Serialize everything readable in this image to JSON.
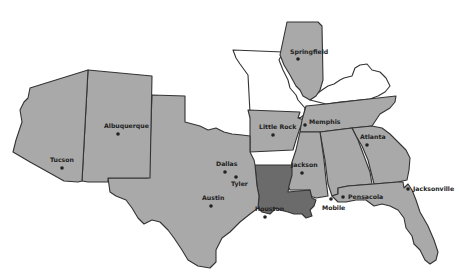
{
  "map": {
    "colors": {
      "background": "#ffffff",
      "state_fill": "#a9a9a9",
      "highlight_fill": "#6b6b6b",
      "outline_only_fill": "#ffffff",
      "stroke": "#333333",
      "label": "#222222"
    },
    "states": [
      {
        "id": "arizona",
        "style": "filled"
      },
      {
        "id": "new-mexico",
        "style": "filled"
      },
      {
        "id": "texas",
        "style": "filled"
      },
      {
        "id": "oklahoma-panhandle",
        "style": "filled"
      },
      {
        "id": "missouri",
        "style": "outline"
      },
      {
        "id": "illinois",
        "style": "filled"
      },
      {
        "id": "kentucky",
        "style": "outline"
      },
      {
        "id": "arkansas",
        "style": "filled"
      },
      {
        "id": "tennessee",
        "style": "filled"
      },
      {
        "id": "louisiana",
        "style": "highlighted"
      },
      {
        "id": "mississippi",
        "style": "filled"
      },
      {
        "id": "alabama",
        "style": "filled"
      },
      {
        "id": "georgia",
        "style": "filled"
      },
      {
        "id": "florida",
        "style": "filled"
      }
    ],
    "cities": [
      {
        "name": "Springfield",
        "x": 298,
        "y": 59,
        "lx": 290,
        "ly": 52
      },
      {
        "name": "Albuquerque",
        "x": 118,
        "y": 133,
        "lx": 104,
        "ly": 127
      },
      {
        "name": "Tucson",
        "x": 62,
        "y": 168,
        "lx": 50,
        "ly": 162
      },
      {
        "name": "Little Rock",
        "x": 273,
        "y": 135,
        "lx": 259,
        "ly": 129
      },
      {
        "name": "Memphis",
        "x": 305,
        "y": 123,
        "lx": 309,
        "ly": 122
      },
      {
        "name": "Atlanta",
        "x": 367,
        "y": 145,
        "lx": 359,
        "ly": 138
      },
      {
        "name": "Dallas",
        "x": 225,
        "y": 172,
        "lx": 216,
        "ly": 166
      },
      {
        "name": "Tyler",
        "x": 236,
        "y": 177,
        "lx": 231,
        "ly": 186
      },
      {
        "name": "Austin",
        "x": 210,
        "y": 206,
        "lx": 202,
        "ly": 200
      },
      {
        "name": "Houston",
        "x": 265,
        "y": 217,
        "lx": 254,
        "ly": 210
      },
      {
        "name": "Jackson",
        "x": 302,
        "y": 173,
        "lx": 290,
        "ly": 166
      },
      {
        "name": "Mobile",
        "x": 332,
        "y": 199,
        "lx": 323,
        "ly": 209
      },
      {
        "name": "Pensacola",
        "x": 343,
        "y": 197,
        "lx": 348,
        "ly": 199
      },
      {
        "name": "Jacksonville",
        "x": 407,
        "y": 188,
        "lx": 412,
        "ly": 190
      }
    ]
  }
}
